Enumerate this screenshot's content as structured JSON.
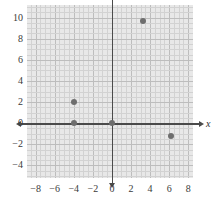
{
  "chart_data": {
    "type": "scatter",
    "title": "",
    "subtitle": "",
    "xlabel": "x",
    "ylabel": "",
    "xlim": [
      -8.9,
      8.5
    ],
    "ylim": [
      -5.2,
      11.2
    ],
    "xticks": [
      -8,
      -6,
      -4,
      -2,
      0,
      2,
      4,
      6,
      8
    ],
    "xticklabels": [
      "-8",
      "-6",
      "-4",
      "-2",
      "0",
      "2",
      "4",
      "6",
      "8"
    ],
    "yticks": [
      -4,
      -2,
      0,
      2,
      4,
      6,
      8,
      10
    ],
    "yticklabels": [
      "-4",
      "-2",
      "0",
      "2",
      "4",
      "6",
      "8",
      "10"
    ],
    "grid": true,
    "grid_minor_step": 0.5,
    "grid_major_step": 2,
    "legend": "none",
    "points": [
      {
        "x": -4,
        "y": 2
      },
      {
        "x": -4,
        "y": 0
      },
      {
        "x": 0,
        "y": 0
      },
      {
        "x": 3.3,
        "y": 9.7
      },
      {
        "x": 6.2,
        "y": -1.2
      }
    ],
    "colors": {
      "point": "#6e6e6e",
      "axis": "#4a4a4a",
      "panel": "#e8e8e8",
      "grid_minor": "#d2d2d2",
      "grid_major": "#bdbdbd",
      "background": "#ffffff",
      "tick_text": "#3a3a3a"
    }
  }
}
